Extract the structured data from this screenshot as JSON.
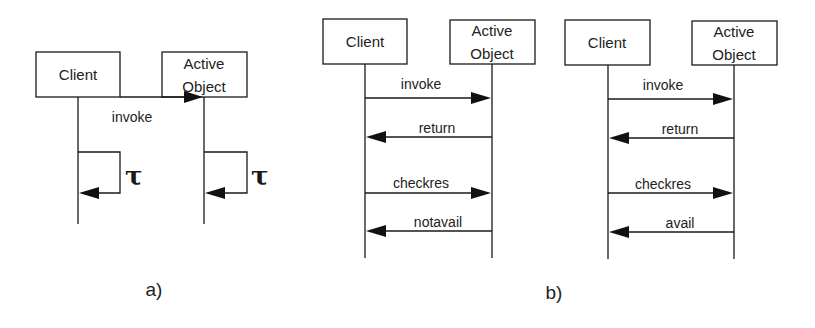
{
  "diagram_a": {
    "caption": "a)",
    "participants": [
      {
        "name": "Client",
        "label": "Client"
      },
      {
        "name": "Active Object",
        "label_line1": "Active",
        "label_line2": "Object"
      }
    ],
    "messages": [
      {
        "from": "Client",
        "to": "Active Object",
        "label": "invoke"
      }
    ],
    "self_loops": [
      {
        "on": "Client",
        "label": "τ"
      },
      {
        "on": "Active Object",
        "label": "τ"
      }
    ]
  },
  "diagram_b": {
    "caption": "b)",
    "left": {
      "participants": [
        {
          "name": "Client",
          "label": "Client"
        },
        {
          "name": "Active Object",
          "label_line1": "Active",
          "label_line2": "Object"
        }
      ],
      "messages": [
        {
          "from": "Client",
          "to": "Active Object",
          "label": "invoke"
        },
        {
          "from": "Active Object",
          "to": "Client",
          "label": "return"
        },
        {
          "from": "Client",
          "to": "Active Object",
          "label": "checkres"
        },
        {
          "from": "Active Object",
          "to": "Client",
          "label": "notavail"
        }
      ]
    },
    "right": {
      "participants": [
        {
          "name": "Client",
          "label": "Client"
        },
        {
          "name": "Active Object",
          "label_line1": "Active",
          "label_line2": "Object"
        }
      ],
      "messages": [
        {
          "from": "Client",
          "to": "Active Object",
          "label": "invoke"
        },
        {
          "from": "Active Object",
          "to": "Client",
          "label": "return"
        },
        {
          "from": "Client",
          "to": "Active Object",
          "label": "checkres"
        },
        {
          "from": "Active Object",
          "to": "Client",
          "label": "avail"
        }
      ]
    }
  }
}
